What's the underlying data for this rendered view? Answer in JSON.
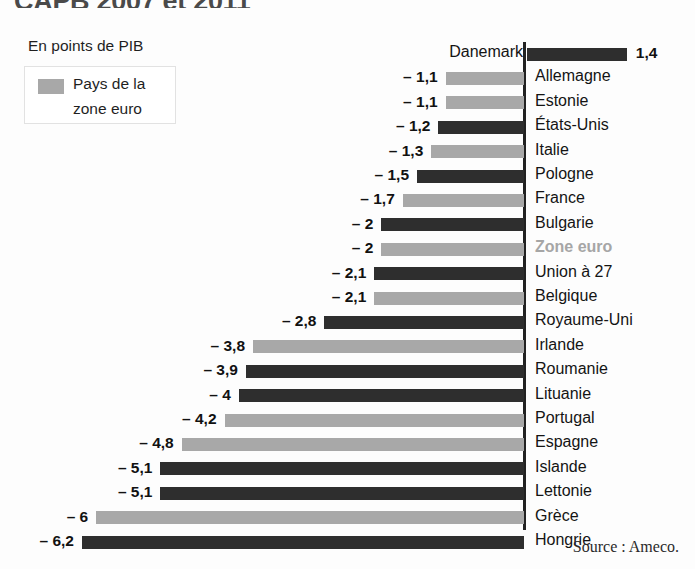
{
  "title": "CAPB 2007 et 2011",
  "legend": {
    "caption": "En points de PIB",
    "series_label_line1": "Pays de la",
    "series_label_line2": "zone euro",
    "swatch_color": "#a8a8a8"
  },
  "colors": {
    "eurozone_bar": "#a8a8a8",
    "other_bar": "#2e2e2e",
    "axis": "#222222",
    "highlight_text": "#a6a6a6"
  },
  "source": "Source : Ameco.",
  "chart_data": {
    "type": "bar",
    "orientation": "horizontal",
    "title": "CAPB 2007 et 2011",
    "xlabel": "En points de PIB",
    "ylabel": "",
    "xlim": [
      -6.2,
      1.4
    ],
    "grid": false,
    "legend": [
      "Pays de la zone euro"
    ],
    "legend_position": "top-left",
    "categories": [
      "Danemark",
      "Allemagne",
      "Estonie",
      "États-Unis",
      "Italie",
      "Pologne",
      "France",
      "Bulgarie",
      "Zone euro",
      "Union à 27",
      "Belgique",
      "Royaume-Uni",
      "Irlande",
      "Roumanie",
      "Lituanie",
      "Portugal",
      "Espagne",
      "Islande",
      "Lettonie",
      "Grèce",
      "Hongrie"
    ],
    "values": [
      1.4,
      -1.1,
      -1.1,
      -1.2,
      -1.3,
      -1.5,
      -1.7,
      -2,
      -2,
      -2.1,
      -2.1,
      -2.8,
      -3.8,
      -3.9,
      -4,
      -4.2,
      -4.8,
      -5.1,
      -5.1,
      -6,
      -6.2
    ],
    "bars": [
      {
        "label": "Danemark",
        "value": 1.4,
        "display": "1,4",
        "eurozone": false,
        "label_side": "left",
        "value_side": "right"
      },
      {
        "label": "Allemagne",
        "value": -1.1,
        "display": "– 1,1",
        "eurozone": true,
        "label_side": "right",
        "value_side": "left"
      },
      {
        "label": "Estonie",
        "value": -1.1,
        "display": "– 1,1",
        "eurozone": true,
        "label_side": "right",
        "value_side": "left"
      },
      {
        "label": "États-Unis",
        "value": -1.2,
        "display": "– 1,2",
        "eurozone": false,
        "label_side": "right",
        "value_side": "left"
      },
      {
        "label": "Italie",
        "value": -1.3,
        "display": "– 1,3",
        "eurozone": true,
        "label_side": "right",
        "value_side": "left"
      },
      {
        "label": "Pologne",
        "value": -1.5,
        "display": "– 1,5",
        "eurozone": false,
        "label_side": "right",
        "value_side": "left"
      },
      {
        "label": "France",
        "value": -1.7,
        "display": "– 1,7",
        "eurozone": true,
        "label_side": "right",
        "value_side": "left"
      },
      {
        "label": "Bulgarie",
        "value": -2,
        "display": "– 2",
        "eurozone": false,
        "label_side": "right",
        "value_side": "left"
      },
      {
        "label": "Zone euro",
        "value": -2,
        "display": "– 2",
        "eurozone": true,
        "label_side": "right",
        "value_side": "left",
        "highlight": true
      },
      {
        "label": "Union à 27",
        "value": -2.1,
        "display": "– 2,1",
        "eurozone": false,
        "label_side": "right",
        "value_side": "left"
      },
      {
        "label": "Belgique",
        "value": -2.1,
        "display": "– 2,1",
        "eurozone": true,
        "label_side": "right",
        "value_side": "left"
      },
      {
        "label": "Royaume-Uni",
        "value": -2.8,
        "display": "– 2,8",
        "eurozone": false,
        "label_side": "right",
        "value_side": "left"
      },
      {
        "label": "Irlande",
        "value": -3.8,
        "display": "– 3,8",
        "eurozone": true,
        "label_side": "right",
        "value_side": "left"
      },
      {
        "label": "Roumanie",
        "value": -3.9,
        "display": "– 3,9",
        "eurozone": false,
        "label_side": "right",
        "value_side": "left"
      },
      {
        "label": "Lituanie",
        "value": -4,
        "display": "– 4",
        "eurozone": false,
        "label_side": "right",
        "value_side": "left"
      },
      {
        "label": "Portugal",
        "value": -4.2,
        "display": "– 4,2",
        "eurozone": true,
        "label_side": "right",
        "value_side": "left"
      },
      {
        "label": "Espagne",
        "value": -4.8,
        "display": "– 4,8",
        "eurozone": true,
        "label_side": "right",
        "value_side": "left"
      },
      {
        "label": "Islande",
        "value": -5.1,
        "display": "– 5,1",
        "eurozone": false,
        "label_side": "right",
        "value_side": "left"
      },
      {
        "label": "Lettonie",
        "value": -5.1,
        "display": "– 5,1",
        "eurozone": false,
        "label_side": "right",
        "value_side": "left"
      },
      {
        "label": "Grèce",
        "value": -6,
        "display": "– 6",
        "eurozone": true,
        "label_side": "right",
        "value_side": "left"
      },
      {
        "label": "Hongrie",
        "value": -6.2,
        "display": "– 6,2",
        "eurozone": false,
        "label_side": "right",
        "value_side": "left"
      }
    ]
  },
  "geometry": {
    "zero_x": 524,
    "px_per_unit": 71.3,
    "first_row_top": 42,
    "row_pitch": 24.4
  }
}
